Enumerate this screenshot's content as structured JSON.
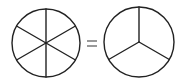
{
  "diagram": {
    "stroke_color": "#222222",
    "background": "#ffffff",
    "left_circle": {
      "cx": 46,
      "cy": 43,
      "r": 34,
      "divisions": 6,
      "spoke_angles_deg": [
        90,
        150,
        210,
        270,
        330,
        30
      ]
    },
    "operator": "=",
    "right_circle": {
      "cx": 139,
      "cy": 42,
      "r": 35,
      "divisions": 3,
      "spoke_angles_deg": [
        270,
        30,
        150
      ]
    }
  }
}
